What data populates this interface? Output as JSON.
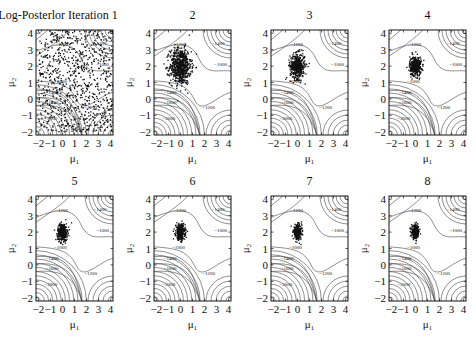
{
  "figure": {
    "title_prefix": "Log-Posterlor Iteration",
    "panels": [
      {
        "label": "1",
        "iteration": 1,
        "spread": 3.2,
        "n": 900,
        "uniform": true
      },
      {
        "label": "2",
        "iteration": 2,
        "spread": 0.55,
        "n": 700,
        "uniform": false
      },
      {
        "label": "3",
        "iteration": 3,
        "spread": 0.38,
        "n": 450,
        "uniform": false
      },
      {
        "label": "4",
        "iteration": 4,
        "spread": 0.3,
        "n": 380,
        "uniform": false
      },
      {
        "label": "5",
        "iteration": 5,
        "spread": 0.26,
        "n": 340,
        "uniform": false
      },
      {
        "label": "6",
        "iteration": 6,
        "spread": 0.24,
        "n": 320,
        "uniform": false
      },
      {
        "label": "7",
        "iteration": 7,
        "spread": 0.22,
        "n": 300,
        "uniform": false
      },
      {
        "label": "8",
        "iteration": 8,
        "spread": 0.2,
        "n": 280,
        "uniform": false
      }
    ],
    "xlabel": "μ₁",
    "ylabel": "μ₂",
    "xticks": [
      "−2",
      "−1",
      "0",
      "1",
      "2",
      "3",
      "4"
    ],
    "yticks": [
      "4",
      "3",
      "2",
      "1",
      "0",
      "−1",
      "−2"
    ],
    "contour_labels": [
      "−1200",
      "−1400",
      "−1000",
      "−1000",
      "−1400",
      "−1600",
      "−1200",
      "−2000"
    ],
    "colors": {
      "ink": "#111111",
      "contour": "#444444",
      "background": "#ffffff"
    }
  },
  "chart_data": {
    "type": "scatter",
    "subplots": [
      "1",
      "2",
      "3",
      "4",
      "5",
      "6",
      "7",
      "8"
    ],
    "xlabel": "μ1",
    "ylabel": "μ2",
    "xlim": [
      -2.2,
      4.2
    ],
    "ylim": [
      -2.2,
      4.2
    ],
    "xticks": [
      -2,
      -1,
      0,
      1,
      2,
      3,
      4
    ],
    "yticks": [
      -2,
      -1,
      0,
      1,
      2,
      3,
      4
    ],
    "contour_levels": [
      -2000,
      -1800,
      -1600,
      -1400,
      -1200,
      -1000
    ],
    "sample_center": [
      0,
      2
    ],
    "sample_spread_by_iteration": [
      3.2,
      0.55,
      0.38,
      0.3,
      0.26,
      0.24,
      0.22,
      0.2
    ]
  }
}
